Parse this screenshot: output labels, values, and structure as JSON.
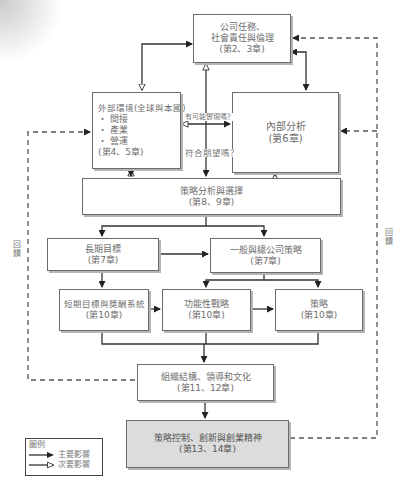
{
  "boxes": {
    "mission": {
      "lines": [
        "公司任務、",
        "社會責任與倫理",
        "(第2、3章)"
      ]
    },
    "external": {
      "title": "外部環境(全球與本國)",
      "bullets": [
        "・ 間接",
        "・ 產業",
        "・ 營運"
      ],
      "chapter": "(第4、5章)"
    },
    "internal": {
      "lines": [
        "內部分析",
        "(第6章)"
      ]
    },
    "strategy_analysis": {
      "lines": [
        "策略分析與選擇",
        "(第8、9章)"
      ]
    },
    "long_term": {
      "lines": [
        "長期目標",
        "(第7章)"
      ]
    },
    "corporate_strategy": {
      "lines": [
        "一般與總公司策略",
        "(第7章)"
      ]
    },
    "short_term": {
      "lines": [
        "短期目標與獎酬系統",
        "(第10章)"
      ]
    },
    "functional": {
      "lines": [
        "功能性戰略",
        "(第10章)"
      ]
    },
    "policies": {
      "lines": [
        "策略",
        "(第10章)"
      ]
    },
    "organization": {
      "lines": [
        "組織結構、領導和文化",
        "(第11、12章)"
      ]
    },
    "control": {
      "lines": [
        "策略控制、創新與創業精神",
        "(第13、14章)"
      ]
    }
  },
  "labels": {
    "feasible": "有可能實現嗎？",
    "desired": "符合期望嗎？",
    "feedback_left": [
      "回",
      "饋"
    ],
    "feedback_right": [
      "回",
      "饋"
    ]
  },
  "legend": {
    "title": "圖例",
    "primary": "主要影響",
    "secondary": "次要影響"
  },
  "colors": {
    "line": "#333333",
    "box_border": "#6b6b6b",
    "control_fill": "#dcdcdc",
    "text": "#6e6e6e"
  }
}
